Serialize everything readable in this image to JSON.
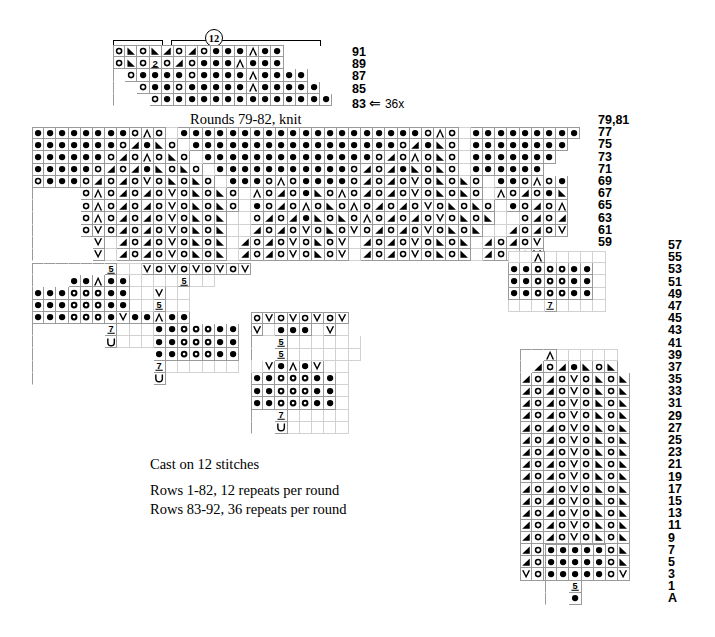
{
  "meta": {
    "ink": "#000000",
    "grid_line": "#9a9a9a",
    "background": "#ffffff"
  },
  "annotations": {
    "circled_repeat": "12",
    "rounds_knit_note": "Rounds 79-82, knit",
    "repeat_marker_row": "83",
    "repeat_marker_arrow": "⇐",
    "repeat_marker_times": "36x"
  },
  "caption": {
    "line1": "Cast on 12 stitches",
    "line2": "Rows 1-82, 12 repeats per round",
    "line3": "Rows 83-92, 36 repeats per round"
  },
  "legend_symbols": {
    "k": "knit-blank",
    "p": "purl-dot",
    "yo": "yarn-over-circle",
    "k2tog": "right-leaning-decrease",
    "ssk": "left-leaning-decrease",
    "cdd": "centered-double-decrease",
    "v": "slip-stitch-v",
    "bobble": "bobble-donut",
    "five": "five-stitch-cluster",
    "seven": "seven-stitch-cluster",
    "two": "two-stitch-cluster",
    "u": "u-hook"
  },
  "top_chart": {
    "name": "rows-83-91-chart",
    "row_labels": [
      "91",
      "89",
      "87",
      "85",
      "83"
    ],
    "rows": [
      {
        "label": "91",
        "offset": 0,
        "cells": [
          "o",
          "ssk",
          "o",
          "ssk",
          "k2t",
          "o",
          "k2t",
          "o",
          "p",
          "p",
          "p",
          "cdd",
          "p",
          "p"
        ]
      },
      {
        "label": "89",
        "offset": 0,
        "cells": [
          "o",
          "ssk",
          "o",
          "two",
          "o",
          "k2t",
          "o",
          "p",
          "p",
          "p",
          "cdd",
          "p",
          "p",
          "p"
        ]
      },
      {
        "label": "87",
        "offset": 1,
        "cells": [
          "o",
          "p",
          "p",
          "p",
          "p",
          "o",
          "p",
          "p",
          "p",
          "p",
          "cdd",
          "p",
          "p",
          "p",
          "p"
        ]
      },
      {
        "label": "85",
        "offset": 2,
        "cells": [
          "o",
          "p",
          "p",
          "o",
          "p",
          "p",
          "p",
          "p",
          "p",
          "cdd",
          "p",
          "p",
          "p",
          "p",
          "p"
        ]
      },
      {
        "label": "83",
        "offset": 3,
        "cells": [
          "o",
          "p",
          "p",
          "p",
          "p",
          "p",
          "p",
          "p",
          "p",
          "p",
          "p",
          "p",
          "p",
          "p",
          "p"
        ]
      }
    ]
  },
  "main_chart": {
    "name": "rows-59-81-chart",
    "row_labels": [
      "79,81",
      "77",
      "75",
      "73",
      "71",
      "69",
      "67",
      "65",
      "63",
      "61",
      "59"
    ],
    "rows": [
      {
        "label": "79,81",
        "offset": 0,
        "cells": [
          "p",
          "p",
          "p",
          "p",
          "p",
          "p",
          "p",
          "p",
          "o",
          "cdd",
          "o",
          "e",
          "p",
          "p",
          "p",
          "p",
          "p",
          "p",
          "p",
          "p",
          "p",
          "p",
          "p",
          "p",
          "p",
          "p",
          "p",
          "p",
          "p",
          "p",
          "p",
          "p",
          "o",
          "cdd",
          "o",
          "e",
          "p",
          "p",
          "p",
          "p",
          "p",
          "p",
          "p",
          "p",
          "p"
        ]
      },
      {
        "label": "77",
        "offset": 0,
        "cells": [
          "p",
          "p",
          "p",
          "p",
          "p",
          "p",
          "p",
          "o",
          "k2t",
          "p",
          "ssk",
          "o",
          "e",
          "p",
          "p",
          "p",
          "p",
          "p",
          "p",
          "p",
          "p",
          "p",
          "p",
          "p",
          "p",
          "p",
          "p",
          "p",
          "p",
          "p",
          "o",
          "k2t",
          "p",
          "ssk",
          "o",
          "e",
          "p",
          "p",
          "p",
          "p",
          "p",
          "p",
          "p",
          "p"
        ]
      },
      {
        "label": "75",
        "offset": 0,
        "cells": [
          "p",
          "p",
          "p",
          "p",
          "p",
          "p",
          "o",
          "k2t",
          "o",
          "cdd",
          "o",
          "ssk",
          "o",
          "e",
          "p",
          "p",
          "p",
          "p",
          "p",
          "p",
          "p",
          "p",
          "p",
          "p",
          "p",
          "p",
          "p",
          "p",
          "o",
          "k2t",
          "o",
          "cdd",
          "o",
          "ssk",
          "o",
          "e",
          "p",
          "p",
          "p",
          "p",
          "p",
          "p",
          "p"
        ]
      },
      {
        "label": "73",
        "offset": 0,
        "cells": [
          "p",
          "p",
          "p",
          "p",
          "p",
          "o",
          "k2t",
          "o",
          "k2t",
          "p",
          "ssk",
          "o",
          "ssk",
          "o",
          "e",
          "p",
          "p",
          "p",
          "p",
          "p",
          "p",
          "p",
          "p",
          "p",
          "p",
          "p",
          "o",
          "k2t",
          "o",
          "k2t",
          "p",
          "ssk",
          "o",
          "ssk",
          "o",
          "e",
          "p",
          "p",
          "p",
          "p",
          "p",
          "p"
        ]
      },
      {
        "label": "71",
        "offset": 0,
        "cells": [
          "o",
          "p",
          "p",
          "p",
          "o",
          "k2t",
          "o",
          "k2t",
          "o",
          "v",
          "o",
          "ssk",
          "o",
          "ssk",
          "o",
          "e",
          "p",
          "p",
          "p",
          "o",
          "cdd",
          "o",
          "p",
          "p",
          "p",
          "p",
          "o",
          "k2t",
          "o",
          "k2t",
          "o",
          "v",
          "o",
          "ssk",
          "o",
          "ssk",
          "o",
          "e",
          "p",
          "p",
          "o",
          "cdd",
          "o",
          "p"
        ]
      },
      {
        "label": "69",
        "offset": 4,
        "cells": [
          "o",
          "cdd",
          "o",
          "k2t",
          "o",
          "k2t",
          "o",
          "v",
          "o",
          "ssk",
          "o",
          "ssk",
          "o",
          "e",
          "cdd",
          "o",
          "k2t",
          "o",
          "p",
          "ssk",
          "o",
          "cdd",
          "o",
          "k2t",
          "o",
          "k2t",
          "o",
          "v",
          "o",
          "ssk",
          "o",
          "ssk",
          "o",
          "e",
          "cdd",
          "o",
          "k2t",
          "o",
          "p",
          "ssk"
        ]
      },
      {
        "label": "67",
        "offset": 4,
        "cells": [
          "o",
          "cdd",
          "o",
          "k2t",
          "o",
          "k2t",
          "o",
          "v",
          "o",
          "ssk",
          "o",
          "ssk",
          "o",
          "e",
          "p",
          "o",
          "k2t",
          "o",
          "cdd",
          "o",
          "ssk",
          "o",
          "cdd",
          "o",
          "k2t",
          "o",
          "k2t",
          "o",
          "v",
          "o",
          "ssk",
          "o",
          "ssk",
          "o",
          "e",
          "p",
          "o",
          "k2t",
          "o",
          "cdd"
        ]
      },
      {
        "label": "65",
        "offset": 4,
        "cells": [
          "o",
          "cdd",
          "o",
          "k2t",
          "o",
          "k2t",
          "o",
          "v",
          "o",
          "ssk",
          "o",
          "ssk",
          "e",
          "e",
          "o",
          "k2t",
          "o",
          "k2t",
          "p",
          "ssk",
          "o",
          "ssk",
          "o",
          "cdd",
          "o",
          "k2t",
          "o",
          "k2t",
          "o",
          "v",
          "o",
          "ssk",
          "o",
          "ssk",
          "e",
          "e",
          "o",
          "k2t",
          "o",
          "k2t"
        ]
      },
      {
        "label": "63",
        "offset": 4,
        "cells": [
          "o",
          "v",
          "o",
          "k2t",
          "o",
          "k2t",
          "o",
          "v",
          "o",
          "ssk",
          "o",
          "ssk",
          "e",
          "e",
          "k2t",
          "o",
          "k2t",
          "o",
          "v",
          "o",
          "ssk",
          "o",
          "v",
          "o",
          "k2t",
          "o",
          "k2t",
          "o",
          "v",
          "o",
          "ssk",
          "o",
          "ssk",
          "e",
          "e",
          "k2t",
          "o",
          "k2t",
          "o",
          "v"
        ]
      },
      {
        "label": "61",
        "offset": 5,
        "cells": [
          "v",
          "e",
          "k2t",
          "o",
          "k2t",
          "o",
          "v",
          "o",
          "ssk",
          "o",
          "ssk",
          "e",
          "k2t",
          "o",
          "k2t",
          "o",
          "v",
          "o",
          "ssk",
          "o",
          "v",
          "e",
          "k2t",
          "o",
          "k2t",
          "o",
          "v",
          "o",
          "ssk",
          "o",
          "ssk",
          "e",
          "k2t",
          "o",
          "k2t",
          "o",
          "v"
        ]
      },
      {
        "label": "59",
        "offset": 5,
        "cells": [
          "v",
          "e",
          "k2t",
          "o",
          "k2t",
          "o",
          "v",
          "o",
          "ssk",
          "o",
          "ssk",
          "e",
          "k2t",
          "o",
          "k2t",
          "o",
          "v",
          "o",
          "ssk",
          "o",
          "v",
          "e",
          "k2t",
          "o",
          "k2t",
          "o",
          "v",
          "o",
          "ssk",
          "o",
          "ssk",
          "e",
          "k2t",
          "o",
          "k2t",
          "o",
          "v"
        ]
      }
    ]
  },
  "lower_rows": {
    "name": "rows-1-57-chart",
    "row_labels": [
      "57",
      "55",
      "53",
      "51",
      "49",
      "47",
      "45",
      "43",
      "41",
      "39",
      "37",
      "35",
      "33",
      "31",
      "29",
      "27",
      "25",
      "23",
      "21",
      "19",
      "17",
      "15",
      "13",
      "11",
      "9",
      "7",
      "5",
      "3",
      "1",
      "A"
    ]
  },
  "motif_labels": {
    "five": "5",
    "seven": "7",
    "two": "2",
    "v": "V",
    "u": "U"
  }
}
